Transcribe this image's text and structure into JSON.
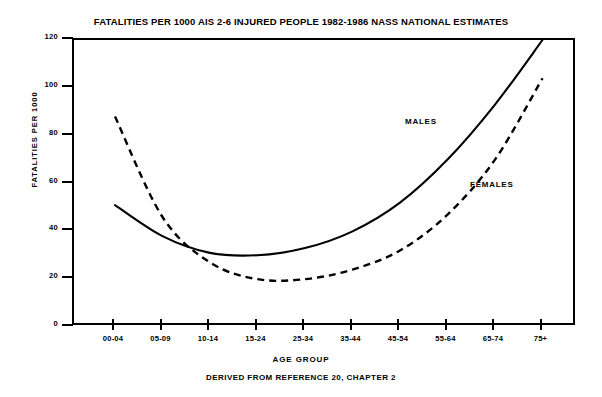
{
  "chart_data": {
    "type": "line",
    "title": "FATALITIES PER 1000 AIS 2-6 INJURED PEOPLE 1982-1986 NASS NATIONAL ESTIMATES",
    "xlabel": "AGE GROUP",
    "ylabel": "FATALITIES PER 1000",
    "footnote": "DERIVED FROM REFERENCE 20, CHAPTER 2",
    "categories": [
      "00-04",
      "05-09",
      "10-14",
      "15-24",
      "25-34",
      "35-44",
      "45-54",
      "55-64",
      "65-74",
      "75+"
    ],
    "xticklabels": [
      "00-04",
      "05-09",
      "10-14",
      "15-24",
      "25-34",
      "35-44",
      "45-54",
      "55-64",
      "65-74",
      "75+"
    ],
    "yticklabels": [
      "0",
      "20",
      "40",
      "60",
      "80",
      "100",
      "120"
    ],
    "yticks": [
      0,
      20,
      40,
      60,
      80,
      100,
      120
    ],
    "ylim": [
      0,
      120
    ],
    "grid": false,
    "legend": "inline-annotations",
    "series": [
      {
        "name": "MALES",
        "style": "solid",
        "color": "#000000",
        "values": [
          51,
          38,
          31,
          30,
          33,
          40,
          52,
          70,
          93,
          120
        ]
      },
      {
        "name": "FEMALES",
        "style": "dashed",
        "color": "#000000",
        "values": [
          88,
          46,
          27,
          20,
          20,
          24,
          32,
          47,
          70,
          104
        ]
      }
    ],
    "annotations": [
      {
        "text": "MALES",
        "series": "MALES"
      },
      {
        "text": "FEMALES",
        "series": "FEMALES"
      }
    ]
  }
}
